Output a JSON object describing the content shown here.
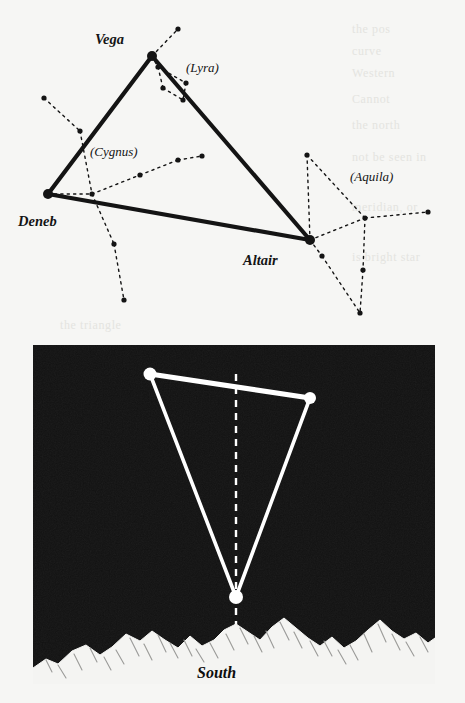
{
  "figure": {
    "paper_color": "#f6f6f4",
    "ink_color": "#141414",
    "sky_color": "#121212",
    "star_color": "#ffffff"
  },
  "showthrough_lines": [
    {
      "text": "the pos",
      "x": 352,
      "y": 22
    },
    {
      "text": "curve",
      "x": 352,
      "y": 44
    },
    {
      "text": "Western",
      "x": 352,
      "y": 66
    },
    {
      "text": "Cannot",
      "x": 352,
      "y": 92
    },
    {
      "text": "the north",
      "x": 352,
      "y": 118
    },
    {
      "text": "not be seen in",
      "x": 352,
      "y": 150
    },
    {
      "text": "meridian, or",
      "x": 352,
      "y": 200
    },
    {
      "text": "is bright star",
      "x": 352,
      "y": 250
    },
    {
      "text": "the triangle",
      "x": 60,
      "y": 318
    }
  ],
  "top_panel": {
    "name": "summer-triangle-constellation-map",
    "labels": [
      {
        "id": "vega",
        "text": "Vega",
        "x": 95,
        "y": 44,
        "style": "major"
      },
      {
        "id": "deneb",
        "text": "Deneb",
        "x": 18,
        "y": 226,
        "style": "major"
      },
      {
        "id": "altair",
        "text": "Altair",
        "x": 243,
        "y": 265,
        "style": "major"
      },
      {
        "id": "lyra",
        "text": "(Lyra)",
        "x": 186,
        "y": 72,
        "style": "minor"
      },
      {
        "id": "cygnus",
        "text": "(Cygnus)",
        "x": 90,
        "y": 156,
        "style": "minor"
      },
      {
        "id": "aquila",
        "text": "(Aquila)",
        "x": 350,
        "y": 181,
        "style": "minor"
      }
    ],
    "bright_stars": [
      {
        "name": "Vega",
        "x": 152,
        "y": 56,
        "r": 5.0
      },
      {
        "name": "Deneb",
        "x": 48,
        "y": 194,
        "r": 5.0
      },
      {
        "name": "Altair",
        "x": 310,
        "y": 240,
        "r": 5.0
      }
    ],
    "triangle_sides": [
      {
        "from": "Vega",
        "to": "Deneb"
      },
      {
        "from": "Vega",
        "to": "Altair"
      },
      {
        "from": "Deneb",
        "to": "Altair"
      }
    ],
    "constellations": [
      {
        "name": "Lyra",
        "stars": [
          {
            "x": 178,
            "y": 29
          },
          {
            "x": 158,
            "y": 67
          },
          {
            "x": 186,
            "y": 83
          },
          {
            "x": 163,
            "y": 88
          },
          {
            "x": 183,
            "y": 100
          }
        ],
        "links": [
          [
            152,
            56,
            178,
            29
          ],
          [
            152,
            56,
            158,
            67
          ],
          [
            158,
            67,
            186,
            83
          ],
          [
            158,
            67,
            163,
            88
          ],
          [
            163,
            88,
            183,
            100
          ],
          [
            186,
            83,
            183,
            100
          ]
        ]
      },
      {
        "name": "Cygnus",
        "stars": [
          {
            "x": 44,
            "y": 98
          },
          {
            "x": 80,
            "y": 131
          },
          {
            "x": 92,
            "y": 194
          },
          {
            "x": 140,
            "y": 175
          },
          {
            "x": 178,
            "y": 160
          },
          {
            "x": 202,
            "y": 156
          },
          {
            "x": 114,
            "y": 244
          },
          {
            "x": 124,
            "y": 300
          }
        ],
        "links": [
          [
            44,
            98,
            80,
            131
          ],
          [
            80,
            131,
            92,
            194
          ],
          [
            92,
            194,
            114,
            244
          ],
          [
            114,
            244,
            124,
            300
          ],
          [
            48,
            194,
            92,
            194
          ],
          [
            92,
            194,
            140,
            175
          ],
          [
            140,
            175,
            178,
            160
          ],
          [
            178,
            160,
            202,
            156
          ]
        ]
      },
      {
        "name": "Aquila",
        "stars": [
          {
            "x": 307,
            "y": 155
          },
          {
            "x": 365,
            "y": 218
          },
          {
            "x": 428,
            "y": 212
          },
          {
            "x": 363,
            "y": 270
          },
          {
            "x": 360,
            "y": 313
          },
          {
            "x": 322,
            "y": 256
          }
        ],
        "links": [
          [
            310,
            240,
            307,
            155
          ],
          [
            307,
            155,
            365,
            218
          ],
          [
            310,
            240,
            365,
            218
          ],
          [
            365,
            218,
            428,
            212
          ],
          [
            365,
            218,
            363,
            270
          ],
          [
            363,
            270,
            360,
            313
          ],
          [
            310,
            240,
            322,
            256
          ],
          [
            322,
            256,
            360,
            313
          ]
        ]
      }
    ]
  },
  "bottom_panel": {
    "name": "night-sky-horizon-view",
    "frame": {
      "x": 33,
      "y": 345,
      "width": 402,
      "height": 339
    },
    "stars": [
      {
        "name": "upper-left-star",
        "x": 150,
        "y": 374,
        "r": 6.5
      },
      {
        "name": "upper-right-star",
        "x": 310,
        "y": 398,
        "r": 6.0
      },
      {
        "name": "lower-star",
        "x": 236,
        "y": 597,
        "r": 7.0
      }
    ],
    "triangle_sides": [
      [
        150,
        374,
        310,
        398
      ],
      [
        150,
        374,
        236,
        597
      ],
      [
        310,
        398,
        236,
        597
      ]
    ],
    "meridian_line": {
      "x": 236,
      "y1": 374,
      "y2": 655
    },
    "direction_label": {
      "text": "South",
      "x": 197,
      "y": 678
    }
  }
}
